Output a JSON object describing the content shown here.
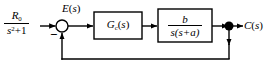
{
  "diagram": {
    "type": "control-system-block-diagram",
    "background_color": "#ffffff",
    "line_color": "#000000",
    "text_color": "#000000",
    "signals": {
      "input": {
        "name": "reference-input",
        "numerator": "R",
        "numerator_subscript": "0",
        "denominator_base": "s",
        "denominator_exponent": "2",
        "denominator_tail": "+1",
        "full_text": "R0/(s^2+1)"
      },
      "error": {
        "name": "error-signal",
        "symbol": "E",
        "argument": "(s)",
        "full_text": "E(s)"
      },
      "output": {
        "name": "output-signal",
        "symbol": "C",
        "argument": "(s)",
        "full_text": "C(s)"
      }
    },
    "summing_junction": {
      "name": "summing-junction",
      "sign_negative": "−",
      "sign_positive": "",
      "cx": 62,
      "cy": 26,
      "r": 6
    },
    "pickoff_node": {
      "name": "pickoff-node",
      "cx": 229,
      "cy": 26,
      "r": 4.5
    },
    "blocks": [
      {
        "id": "controller",
        "name": "controller-block",
        "symbol": "G",
        "subscript": "c",
        "argument": "(s)",
        "full_text": "Gc(s)",
        "is_fraction": false,
        "x": 94,
        "y": 12,
        "w": 48,
        "h": 27
      },
      {
        "id": "plant",
        "name": "plant-block",
        "numerator": "b",
        "denominator": "s(s+a)",
        "full_text": "b/(s(s+a))",
        "is_fraction": true,
        "x": 158,
        "y": 9,
        "w": 54,
        "h": 33
      }
    ],
    "feedback_path": {
      "name": "feedback-path",
      "description": "unity feedback from output pickoff node back to summing junction",
      "y": 59
    }
  }
}
